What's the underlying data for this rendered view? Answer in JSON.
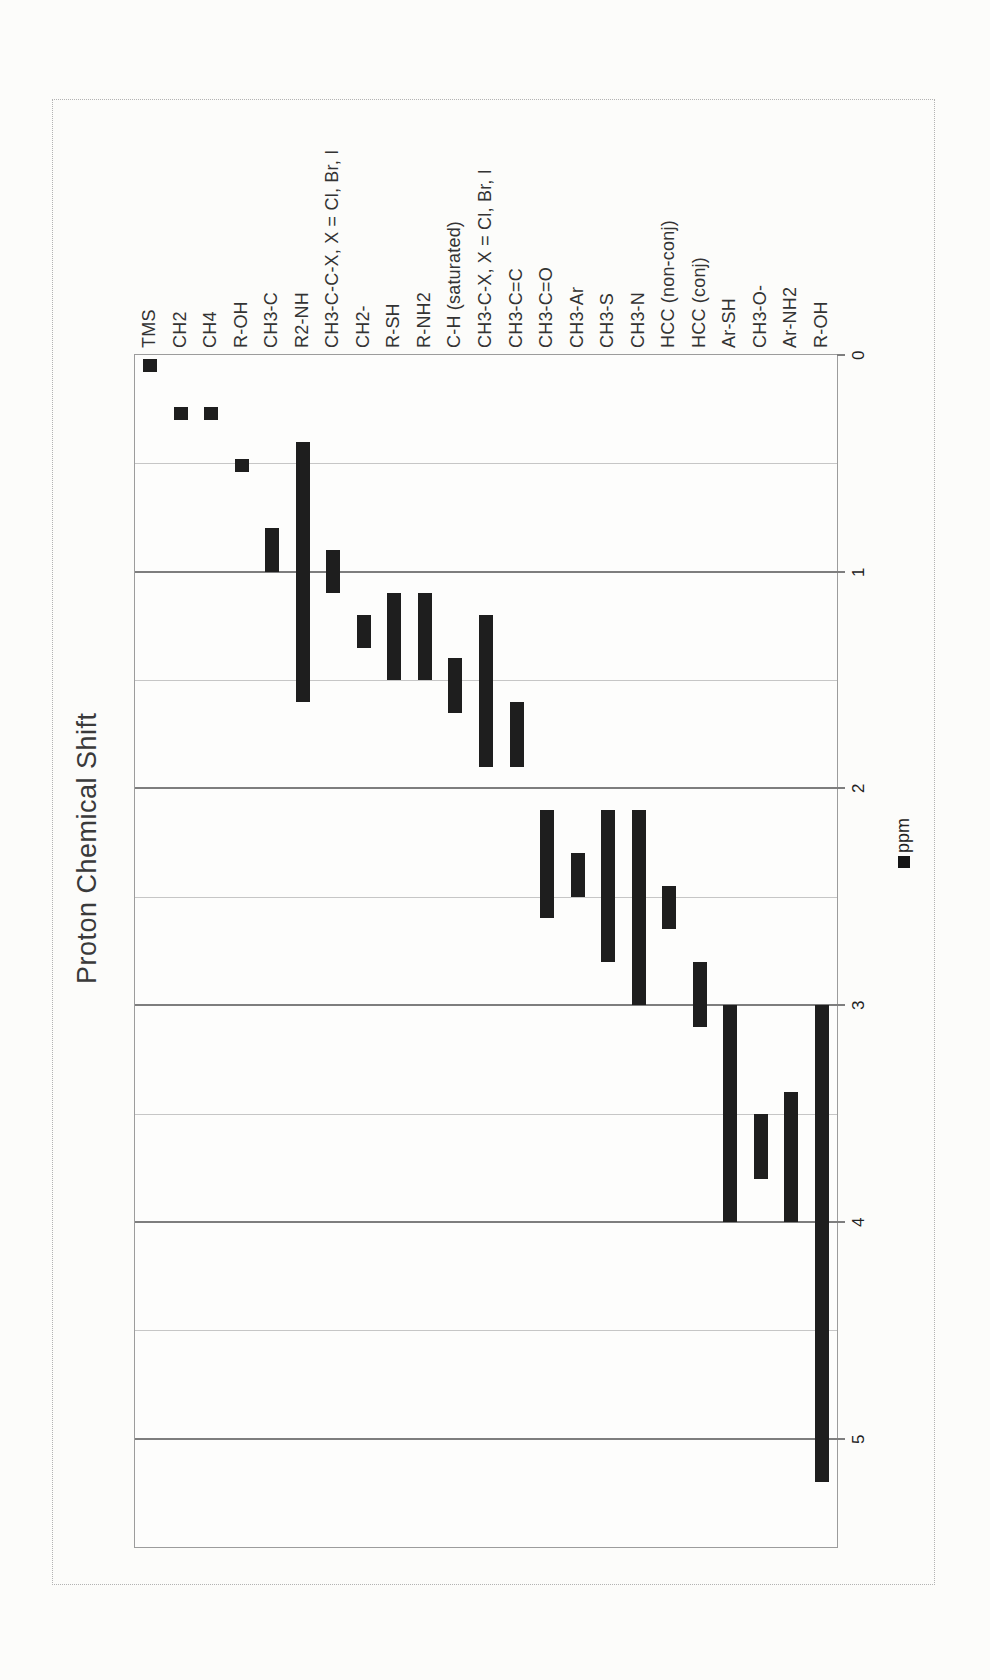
{
  "chart_data": {
    "type": "bar",
    "subtype": "floating-range-columns",
    "title": "Proton Chemical Shift",
    "series": [
      {
        "name": "ppm"
      }
    ],
    "value_axis": {
      "label": "ppm",
      "min": 0,
      "max": 5.5,
      "major_step": 1,
      "minor_gridline_step": 0.5,
      "tick_labels": [
        "0",
        "1",
        "2",
        "3",
        "4",
        "5"
      ]
    },
    "orientation_note": "entire chart is rotated 90deg counter-clockwise on the page; ppm axis runs downward, all text reads bottom-to-top",
    "grid": true,
    "legend_position": "outside value-axis side, marker below label",
    "categories": [
      "TMS",
      "CH2",
      "CH4",
      "R-OH",
      "CH3-C",
      "R2-NH",
      "CH3-C-C-X, X = Cl, Br, I",
      "CH2-",
      "R-SH",
      "R-NH2",
      "C-H (saturated)",
      "CH3-C-X, X = Cl, Br, I",
      "CH3-C=C",
      "CH3-C=O",
      "CH3-Ar",
      "CH3-S",
      "CH3-N",
      "HCC (non-conj)",
      "HCC (conj)",
      "Ar-SH",
      "CH3-O-",
      "Ar-NH2",
      "R-OH"
    ],
    "ranges_ppm": [
      [
        0.02,
        0.08
      ],
      [
        0.24,
        0.3
      ],
      [
        0.24,
        0.3
      ],
      [
        0.48,
        0.54
      ],
      [
        0.8,
        1.0
      ],
      [
        0.4,
        1.6
      ],
      [
        0.9,
        1.1
      ],
      [
        1.2,
        1.35
      ],
      [
        1.1,
        1.5
      ],
      [
        1.1,
        1.5
      ],
      [
        1.4,
        1.65
      ],
      [
        1.2,
        1.9
      ],
      [
        1.6,
        1.9
      ],
      [
        2.1,
        2.6
      ],
      [
        2.3,
        2.5
      ],
      [
        2.1,
        2.8
      ],
      [
        2.1,
        3.0
      ],
      [
        2.45,
        2.65
      ],
      [
        2.8,
        3.1
      ],
      [
        3.0,
        4.0
      ],
      [
        3.5,
        3.8
      ],
      [
        3.4,
        4.0
      ],
      [
        3.0,
        5.2
      ]
    ]
  },
  "colors": {
    "bar": "#1e1e1e",
    "grid_major": "#7e7e7e",
    "grid_minor": "#c6c6c6",
    "plot_border": "#9c9c9c",
    "chart_border": "#b3b3b3",
    "text": "#2b2b2b",
    "background": "#fcfcfa"
  }
}
